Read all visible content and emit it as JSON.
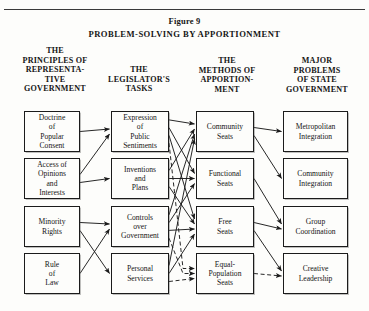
{
  "figure": {
    "label": "Figure 9",
    "title": "PROBLEM-SOLVING BY APPORTIONMENT"
  },
  "columns": [
    {
      "name": "principles",
      "heading": "THE\nPRINCIPLES OF\nREPRESENTA-\nTIVE\nGOVERNMENT"
    },
    {
      "name": "legislator-tasks",
      "heading": "THE\nLEGISLATOR'S\nTASKS"
    },
    {
      "name": "methods",
      "heading": "THE\nMETHODS OF\nAPPORTION-\nMENT"
    },
    {
      "name": "problems",
      "heading": "MAJOR\nPROBLEMS\nOF STATE\nGOVERNMENT"
    }
  ],
  "nodes": {
    "c1r1": "Doctrine\nof\nPopular\nConsent",
    "c1r2": "Access of\nOpinions\nand\nInterests",
    "c1r3": "Minority\nRights",
    "c1r4": "Rule\nof\nLaw",
    "c2r1": "Expression\nof\nPublic\nSentiments",
    "c2r2": "Inventions\nand\nPlans",
    "c2r3": "Controls\nover\nGovernment",
    "c2r4": "Personal\nServices",
    "c3r1": "Community\nSeats",
    "c3r2": "Functional\nSeats",
    "c3r3": "Free\nSeats",
    "c3r4": "Equal-\nPopulation\nSeats",
    "c4r1": "Metropolitan\nIntegration",
    "c4r2": "Community\nIntegration",
    "c4r3": "Group\nCoordination",
    "c4r4": "Creative\nLeadership"
  },
  "edges": [
    {
      "from": "c1r1",
      "to": "c2r1",
      "style": "solid"
    },
    {
      "from": "c1r2",
      "to": "c2r1",
      "style": "solid"
    },
    {
      "from": "c1r2",
      "to": "c2r2",
      "style": "solid"
    },
    {
      "from": "c1r3",
      "to": "c2r3",
      "style": "solid"
    },
    {
      "from": "c1r3",
      "to": "c2r4",
      "style": "solid"
    },
    {
      "from": "c1r4",
      "to": "c2r3",
      "style": "solid"
    },
    {
      "from": "c2r1",
      "to": "c3r1",
      "style": "solid"
    },
    {
      "from": "c2r1",
      "to": "c3r2",
      "style": "solid"
    },
    {
      "from": "c2r1",
      "to": "c3r3",
      "style": "solid"
    },
    {
      "from": "c2r1",
      "to": "c3r4",
      "style": "dashed"
    },
    {
      "from": "c2r2",
      "to": "c3r1",
      "style": "solid"
    },
    {
      "from": "c2r2",
      "to": "c3r2",
      "style": "solid"
    },
    {
      "from": "c2r2",
      "to": "c3r3",
      "style": "solid"
    },
    {
      "from": "c2r3",
      "to": "c3r1",
      "style": "solid"
    },
    {
      "from": "c2r3",
      "to": "c3r2",
      "style": "solid"
    },
    {
      "from": "c2r3",
      "to": "c3r3",
      "style": "solid"
    },
    {
      "from": "c2r3",
      "to": "c3r4",
      "style": "dashed"
    },
    {
      "from": "c2r4",
      "to": "c3r1",
      "style": "solid"
    },
    {
      "from": "c2r4",
      "to": "c3r3",
      "style": "solid"
    },
    {
      "from": "c2r4",
      "to": "c3r4",
      "style": "dashed"
    },
    {
      "from": "c3r1",
      "to": "c4r1",
      "style": "solid"
    },
    {
      "from": "c3r1",
      "to": "c4r2",
      "style": "solid"
    },
    {
      "from": "c3r2",
      "to": "c4r3",
      "style": "solid"
    },
    {
      "from": "c3r3",
      "to": "c4r3",
      "style": "solid"
    },
    {
      "from": "c3r3",
      "to": "c4r4",
      "style": "solid"
    },
    {
      "from": "c3r4",
      "to": "c4r4",
      "style": "dashed"
    }
  ],
  "colors": {
    "ink": "#1b1b1b",
    "paper": "#fdfdfb"
  }
}
